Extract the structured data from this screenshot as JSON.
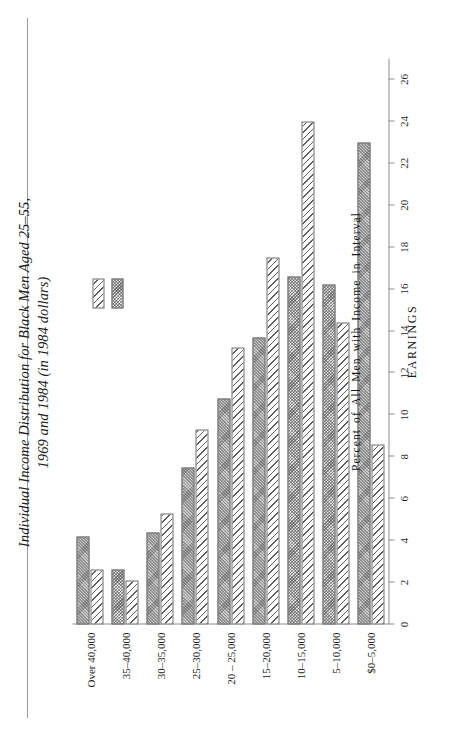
{
  "page": {
    "title_line1": "Individual Income Distribution for Black Men Aged 25–55,",
    "title_line2": "1969 and 1984 (in 1984 dollars)"
  },
  "legend": {
    "items": [
      {
        "label": "1969",
        "swatch": "diagonal-hatch-swatch"
      },
      {
        "label": "1984",
        "swatch": "solid-gray-swatch"
      }
    ]
  },
  "chart_data": {
    "type": "bar",
    "orientation": "horizontal",
    "title": "Individual Income Distribution for Black Men Aged 25–55, 1969 and 1984 (in 1984 dollars)",
    "xlabel": "EARNINGS",
    "ylabel": "Percent of All Men with Income in Interval",
    "categories": [
      "$0–5,000",
      "5–10,000",
      "10–15,000",
      "15–20,000",
      "20 – 25,000",
      "25–30,000",
      "30–35,000",
      "35–40,000",
      "Over 40,000"
    ],
    "series": [
      {
        "name": "1969",
        "values": [
          8.6,
          14.4,
          24.0,
          17.5,
          13.2,
          9.3,
          5.3,
          2.1,
          2.6
        ]
      },
      {
        "name": "1984",
        "values": [
          23.0,
          16.2,
          16.6,
          13.7,
          10.8,
          7.5,
          4.4,
          2.6,
          4.2
        ]
      }
    ],
    "value_axis_ticks": [
      0,
      2,
      4,
      6,
      8,
      10,
      12,
      14,
      16,
      18,
      20,
      22,
      24,
      26
    ],
    "value_axis_tick_labels": [
      "0",
      "2",
      "4",
      "6",
      "8",
      "10",
      "12",
      "14",
      "16",
      "18",
      "20",
      "22",
      "24",
      "26"
    ],
    "xlim": [
      0,
      27
    ],
    "grid": false,
    "legend_position": "upper-right"
  }
}
